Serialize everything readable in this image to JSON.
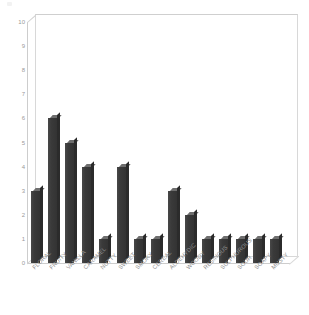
{
  "chart_data": {
    "type": "bar",
    "title": "",
    "subtitle": "",
    "xlabel": "",
    "ylabel": "",
    "ylim": [
      0,
      10
    ],
    "ytick_labels": [
      "10",
      "9",
      "8",
      "7",
      "6",
      "5",
      "4",
      "3",
      "2",
      "1",
      "0"
    ],
    "ytick_values": [
      10,
      9,
      8,
      7,
      6,
      5,
      4,
      3,
      2,
      1,
      0
    ],
    "grid": false,
    "legend": null,
    "style": "3d-column",
    "bar_color": "#3a3a3a",
    "bar_top_color": "#6e6e6e",
    "bar_side_color": "#2b2b2b",
    "frame_color": "#d8d8d8",
    "axis_text_color": "#929292",
    "background": "#ffffff",
    "categories": [
      "FLORAL",
      "FRUITY",
      "VANILLA",
      "CARAMEL",
      "NUTTY",
      "SWEET",
      "SMOKY",
      "CEREAL",
      "ALDEHYDIC",
      "WOODY",
      "RESINOUS",
      "SULPHUROUS",
      "SOUR",
      "SOAPY",
      "MUSTY"
    ],
    "values": [
      3,
      6,
      5,
      4,
      1,
      4,
      1,
      1,
      3,
      2,
      1,
      1,
      1,
      1,
      1
    ]
  }
}
